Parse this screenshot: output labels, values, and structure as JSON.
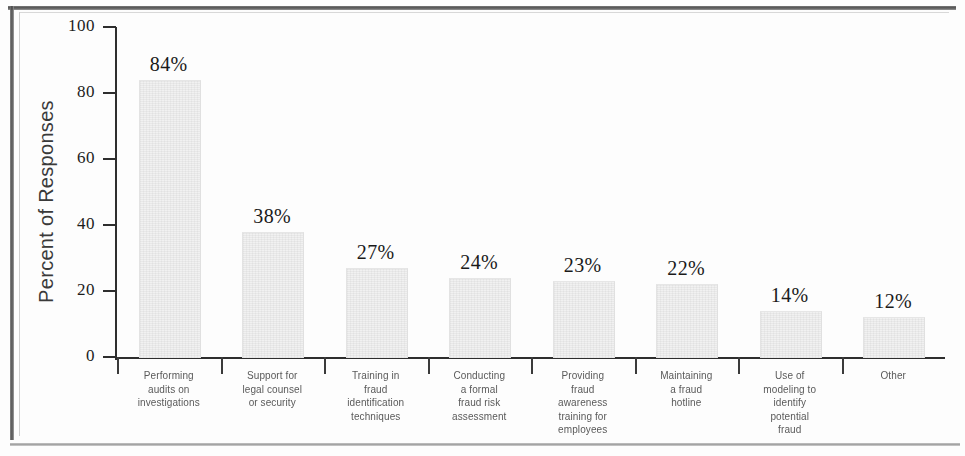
{
  "chart_data": {
    "type": "bar",
    "title": "",
    "xlabel": "",
    "ylabel": "Percent of Responses",
    "ylim": [
      0,
      100
    ],
    "ytick_labels": [
      "100",
      "80",
      "60",
      "40",
      "20",
      "0"
    ],
    "yticks": [
      100,
      80,
      60,
      40,
      20,
      0
    ],
    "grid": false,
    "legend": null,
    "categories": [
      "Performing audits on investigations",
      "Support for legal counsel or security",
      "Training in fraud identification techniques",
      "Conducting a formal fraud risk assessment",
      "Providing fraud awareness training for employees",
      "Maintaining a fraud hotline",
      "Use of modeling to identify potential fraud",
      "Other"
    ],
    "category_lines": [
      [
        "Performing",
        "audits on",
        "investigations"
      ],
      [
        "Support for",
        "legal counsel",
        "or security"
      ],
      [
        "Training in",
        "fraud",
        "identification",
        "techniques"
      ],
      [
        "Conducting",
        "a formal",
        "fraud risk",
        "assessment"
      ],
      [
        "Providing",
        "fraud",
        "awareness",
        "training for",
        "employees"
      ],
      [
        "Maintaining",
        "a fraud",
        "hotline"
      ],
      [
        "Use of",
        "modeling to",
        "identify",
        "potential",
        "fraud"
      ],
      [
        "Other"
      ]
    ],
    "values": [
      84,
      38,
      27,
      24,
      23,
      22,
      14,
      12
    ],
    "value_labels": [
      "84%",
      "38%",
      "27%",
      "24%",
      "23%",
      "22%",
      "14%",
      "12%"
    ],
    "bar_color": "#f1f1f1",
    "axis_color": "#2e2e2e",
    "text_color": "#1a1a1a"
  }
}
